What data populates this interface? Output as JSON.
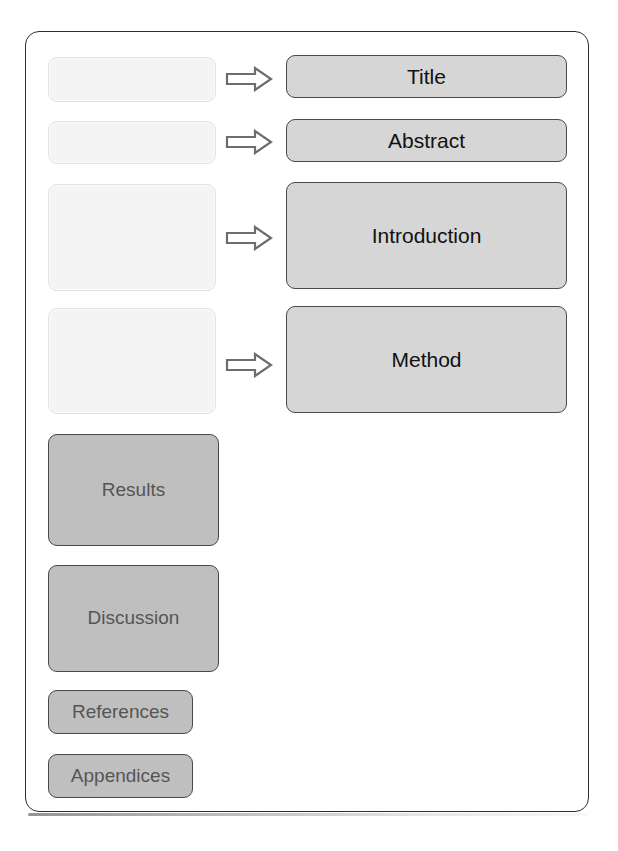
{
  "figure": {
    "type": "flow-diagram",
    "background_color": "#ffffff",
    "frame_border_color": "#2e2e2e"
  },
  "colors": {
    "ghost_fill": "#f4f4f4",
    "ghost_border": "#e3e3e3",
    "section_fill": "#d6d6d6",
    "section_border": "#4a4a4a",
    "section_text": "#111111",
    "stage_fill": "#bfbfbf",
    "stage_border": "#4a4a4a",
    "stage_text": "#555555",
    "arrow_outline": "#6d6d6d",
    "arrow_fill": "#ffffff"
  },
  "placeholders": [
    {
      "id": "placeholder-1",
      "label": "",
      "x": 47,
      "y": 56,
      "w": 168,
      "h": 45
    },
    {
      "id": "placeholder-2",
      "label": "",
      "x": 47,
      "y": 120,
      "w": 168,
      "h": 43
    },
    {
      "id": "placeholder-3",
      "label": "",
      "x": 47,
      "y": 183,
      "w": 168,
      "h": 107
    },
    {
      "id": "placeholder-4",
      "label": "",
      "x": 47,
      "y": 307,
      "w": 168,
      "h": 106
    }
  ],
  "arrows": [
    {
      "id": "arrow-1",
      "from": "placeholder-1",
      "to": "section-title",
      "x": 224,
      "y": 65
    },
    {
      "id": "arrow-2",
      "from": "placeholder-2",
      "to": "section-abstract",
      "x": 224,
      "y": 128
    },
    {
      "id": "arrow-3",
      "from": "placeholder-3",
      "to": "section-introduction",
      "x": 224,
      "y": 224
    },
    {
      "id": "arrow-4",
      "from": "placeholder-4",
      "to": "section-method",
      "x": 224,
      "y": 351
    }
  ],
  "sections": [
    {
      "id": "section-title",
      "label": "Title",
      "x": 285,
      "y": 54,
      "w": 281,
      "h": 43
    },
    {
      "id": "section-abstract",
      "label": "Abstract",
      "x": 285,
      "y": 118,
      "w": 281,
      "h": 43
    },
    {
      "id": "section-introduction",
      "label": "Introduction",
      "x": 285,
      "y": 181,
      "w": 281,
      "h": 107
    },
    {
      "id": "section-method",
      "label": "Method",
      "x": 285,
      "y": 305,
      "w": 281,
      "h": 107
    }
  ],
  "stages": [
    {
      "id": "stage-results",
      "label": "Results",
      "x": 47,
      "y": 433,
      "w": 171,
      "h": 112
    },
    {
      "id": "stage-discussion",
      "label": "Discussion",
      "x": 47,
      "y": 564,
      "w": 171,
      "h": 107
    },
    {
      "id": "stage-references",
      "label": "References",
      "x": 47,
      "y": 689,
      "w": 145,
      "h": 44
    },
    {
      "id": "stage-appendices",
      "label": "Appendices",
      "x": 47,
      "y": 753,
      "w": 145,
      "h": 44
    }
  ]
}
